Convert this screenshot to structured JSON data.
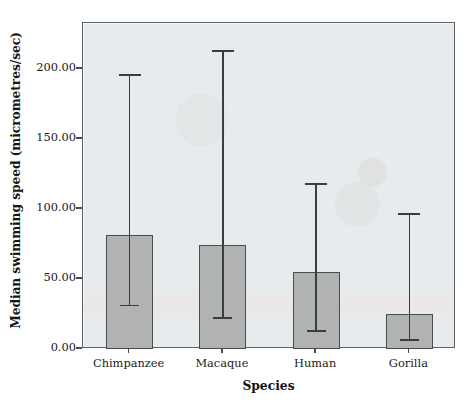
{
  "chart_data": {
    "type": "bar",
    "title": "",
    "subtitle": "",
    "xlabel": "Species",
    "ylabel": "Median swimming speed (micrometres/sec)",
    "categories": [
      "Chimpanzee",
      "Macaque",
      "Human",
      "Gorilla"
    ],
    "values": [
      81.5,
      74.5,
      55.0,
      25.0
    ],
    "error_bars": {
      "upper": [
        196.0,
        213.0,
        118.0,
        96.5
      ],
      "lower": [
        31.0,
        22.0,
        13.0,
        6.5
      ]
    },
    "ylim": [
      0,
      233
    ],
    "xlim_note": "categorical",
    "yticks": [
      0,
      50,
      100,
      150,
      200
    ],
    "ytick_labels": [
      "0.00",
      "50.00",
      "100.00",
      "150.00",
      "200.00"
    ],
    "grid": false,
    "legend": null,
    "legend_position": "none",
    "series": [
      {
        "name": "Median swimming speed",
        "values": [
          81.5,
          74.5,
          55.0,
          25.0
        ],
        "upper": [
          196.0,
          213.0,
          118.0,
          96.5
        ],
        "lower": [
          31.0,
          22.0,
          13.0,
          6.5
        ]
      }
    ],
    "annotations": []
  },
  "style": {
    "bar_fill": "#b1b2b2",
    "bar_stroke": "#4a4d50",
    "plot_background": "#e7ebee",
    "frame_stroke": "#5d6266",
    "error_bar_color": "#3a3d40",
    "text_color": "#1a1a1a",
    "figure_background": "#ffffff"
  }
}
